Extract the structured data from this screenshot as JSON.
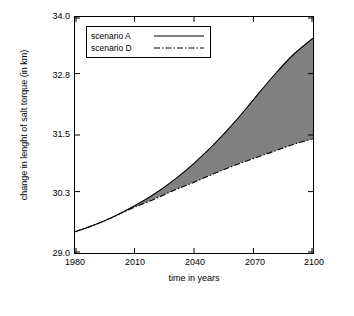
{
  "chart_data": {
    "type": "line",
    "title": "",
    "xlabel": "time in years",
    "ylabel": "change in lenght of salt torque (in km)",
    "xlim": [
      1980,
      2100
    ],
    "ylim": [
      29.0,
      34.0
    ],
    "xticks": [
      1980,
      2010,
      2040,
      2070,
      2100
    ],
    "yticks": [
      29.0,
      30.3,
      31.5,
      32.8,
      34.0
    ],
    "ytick_labels": [
      "29.0",
      "30.3",
      "31.5",
      "32.8",
      "34.0"
    ],
    "xtick_labels": [
      "1980",
      "2010",
      "2040",
      "2070",
      "2100"
    ],
    "grid": false,
    "legend_position": "top-left-inside",
    "shaded_between_series": true,
    "shade_color": "#808080",
    "series": [
      {
        "name": "scenario A",
        "style": "solid",
        "color": "#000000",
        "x": [
          1980,
          1990,
          2000,
          2010,
          2020,
          2030,
          2040,
          2050,
          2060,
          2070,
          2080,
          2090,
          2100
        ],
        "y": [
          29.45,
          29.6,
          29.78,
          30.0,
          30.25,
          30.55,
          30.9,
          31.3,
          31.75,
          32.25,
          32.75,
          33.2,
          33.55
        ]
      },
      {
        "name": "scenario D",
        "style": "dash-dot",
        "color": "#000000",
        "x": [
          1980,
          1990,
          2000,
          2010,
          2020,
          2030,
          2040,
          2050,
          2060,
          2070,
          2080,
          2090,
          2100
        ],
        "y": [
          29.45,
          29.6,
          29.78,
          29.97,
          30.14,
          30.33,
          30.5,
          30.68,
          30.85,
          31.0,
          31.15,
          31.3,
          31.42
        ]
      }
    ]
  },
  "legend": {
    "items": [
      {
        "label": "scenario A",
        "style": "solid"
      },
      {
        "label": "scenario D",
        "style": "dash-dot"
      }
    ]
  }
}
